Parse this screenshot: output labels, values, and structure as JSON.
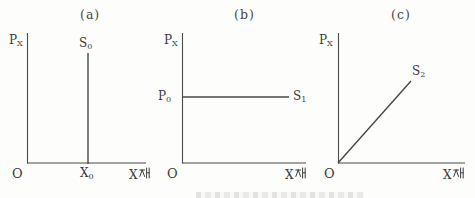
{
  "figure": {
    "colors": {
      "line": "#4a4a4a",
      "text": "#3a3a3a",
      "background": "#fdfdfb"
    },
    "panels": [
      {
        "caption": "(a)",
        "y_axis": {
          "letter": "P",
          "sub": "X"
        },
        "x_axis": {
          "letter": "X",
          "hangul": "재",
          "full_label": "X재"
        },
        "origin": "O",
        "curve": {
          "letter": "S",
          "sub": "0",
          "type": "vertical"
        },
        "x_tick": {
          "letter": "X",
          "sub": "0"
        }
      },
      {
        "caption": "(b)",
        "y_axis": {
          "letter": "P",
          "sub": "X"
        },
        "x_axis": {
          "letter": "X",
          "hangul": "재",
          "full_label": "X재"
        },
        "origin": "O",
        "curve": {
          "letter": "S",
          "sub": "1",
          "type": "horizontal"
        },
        "y_tick": {
          "letter": "P",
          "sub": "0"
        }
      },
      {
        "caption": "(c)",
        "y_axis": {
          "letter": "P",
          "sub": "X"
        },
        "x_axis": {
          "letter": "X",
          "hangul": "재",
          "full_label": "X재"
        },
        "origin": "O",
        "curve": {
          "letter": "S",
          "sub": "2",
          "type": "diagonal"
        }
      }
    ]
  }
}
